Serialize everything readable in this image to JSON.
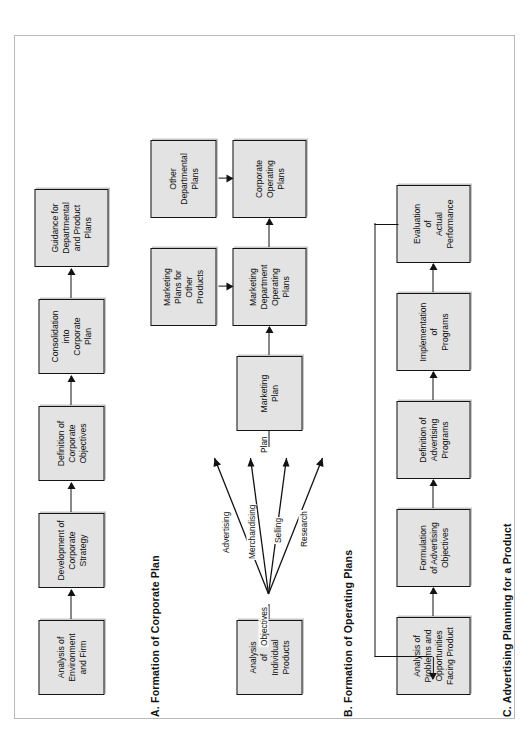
{
  "figure": {
    "orientation": "rotated-90-ccw",
    "background": "#ffffff",
    "box_fill": "#e3e3e3",
    "box_stroke": "#141414"
  },
  "sections": [
    {
      "id": "a",
      "title": "A.  Formation of Corporate Plan",
      "boxes": [
        {
          "lines": "Analysis of\nEnvironment\nand Firm"
        },
        {
          "lines": "Development of\nCorporate\nStrategy"
        },
        {
          "lines": "Definition of\nCorporate\nObjectives"
        },
        {
          "lines": "Consolidation\ninto\nCorporate\nPlan"
        },
        {
          "lines": "Guidance for\nDepartmental\nand Product\nPlans"
        }
      ]
    },
    {
      "id": "b",
      "title": "B.  Formation of Operating Plans",
      "boxes": [
        {
          "lines": "Analysis\nof\nIndividual\nProducts"
        },
        {
          "lines": "Marketing\nPlan"
        },
        {
          "lines": "Marketing\nDepartment\nOperating\nPlans"
        },
        {
          "lines": "Corporate\nOperating\nPlans"
        },
        {
          "lines": "Marketing\nPlans for\nOther\nProducts"
        },
        {
          "lines": "Other\nDepartmental\nPlans"
        }
      ],
      "fan": {
        "start_label": "Objectives",
        "end_label": "Plan",
        "branches": [
          "Advertising",
          "Merchandising",
          "Selling",
          "Research"
        ]
      }
    },
    {
      "id": "c",
      "title": "C.  Advertising Planning for a Product",
      "boxes": [
        {
          "lines": "Analysis of\nProblems and\nOpportunities\nFacing Product"
        },
        {
          "lines": "Formulation\nof Advertising\nObjectives"
        },
        {
          "lines": "Definition of\nAdvertising\nPrograms"
        },
        {
          "lines": "Implementation\nof\nPrograms"
        },
        {
          "lines": "Evaluation\nof\nActual\nPerformance"
        }
      ],
      "feedback_loop": true
    }
  ]
}
